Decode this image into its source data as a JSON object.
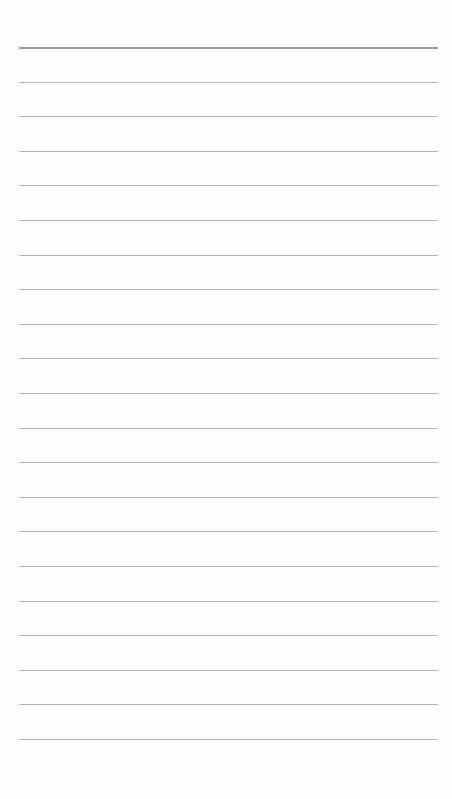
{
  "page": {
    "type": "lined-paper",
    "line_count": 21,
    "first_line_y": 47,
    "line_spacing": 34.6,
    "line_left": 19,
    "line_width": 419,
    "colors": {
      "background": "#fefefe",
      "line": "#b4b4b4",
      "header_line": "#9a9a9a"
    }
  }
}
